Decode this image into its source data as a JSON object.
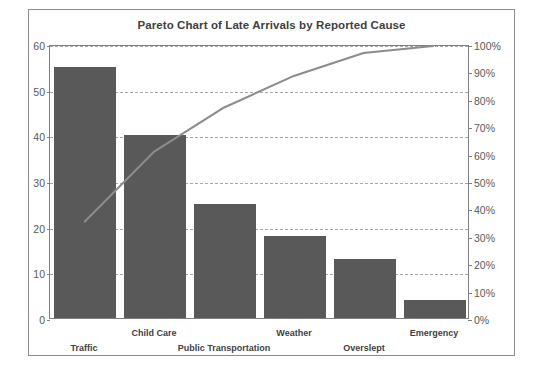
{
  "chart_data": {
    "type": "bar",
    "title": "Pareto Chart of Late Arrivals by Reported Cause",
    "categories": [
      "Traffic",
      "Child Care",
      "Public Transportation",
      "Weather",
      "Overslept",
      "Emergency"
    ],
    "series": [
      {
        "name": "Count",
        "type": "bar",
        "axis": "left",
        "values": [
          55,
          40,
          25,
          18,
          13,
          4
        ]
      },
      {
        "name": "Cumulative Percentage",
        "type": "line",
        "axis": "right",
        "values": [
          35.5,
          61.3,
          77.4,
          89.0,
          97.4,
          100.0
        ]
      }
    ],
    "xlabel": "",
    "ylabel": "",
    "ylim": [
      0,
      60
    ],
    "y_ticks": [
      "0",
      "10",
      "20",
      "30",
      "40",
      "50",
      "60"
    ],
    "y2label": "",
    "y2lim": [
      0,
      100
    ],
    "y2_ticks": [
      "0%",
      "10%",
      "20%",
      "30%",
      "40%",
      "50%",
      "60%",
      "70%",
      "80%",
      "90%",
      "100%"
    ],
    "gridlines": [
      "10",
      "20",
      "30",
      "40",
      "50",
      "60"
    ],
    "grid": true,
    "legend": "none",
    "colors": {
      "bar": "#595959",
      "line": "#8c8c8c",
      "grid": "#a6a6a6",
      "axis": "#7f7f7f",
      "frame": "#8c8c8c",
      "text": "#3f3f3f",
      "background": "#ffffff"
    },
    "label_rows": [
      "lower",
      "upper",
      "lower",
      "upper",
      "lower",
      "upper"
    ]
  }
}
